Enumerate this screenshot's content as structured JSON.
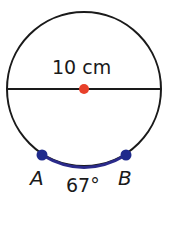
{
  "diagram": {
    "shape": "circle",
    "diameter_label": "10 cm",
    "arc_measure_label": "67°",
    "points": [
      {
        "name": "A",
        "color": "#1f2a8c"
      },
      {
        "name": "B",
        "color": "#1f2a8c"
      }
    ],
    "center_color": "#e8402a",
    "arc_color": "#2a2a8a",
    "line_color": "#1a1a1a"
  }
}
